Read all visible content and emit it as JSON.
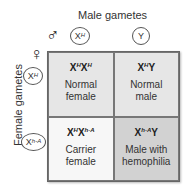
{
  "header": {
    "male_label": "Male gametes",
    "male_symbol": "♂",
    "female_symbol": "♀"
  },
  "side": {
    "female_label": "Female gametes"
  },
  "male_gametes": [
    {
      "base": "X",
      "sup": "H"
    },
    {
      "base": "Y",
      "sup": ""
    }
  ],
  "female_gametes": [
    {
      "base": "X",
      "sup": "H"
    },
    {
      "base": "X",
      "sup": "h-A"
    }
  ],
  "cells": [
    {
      "geno1": "X",
      "sup1": "H",
      "geno2": "X",
      "sup2": "H",
      "pheno1": "Normal",
      "pheno2": "female",
      "color": "#e6e6e6"
    },
    {
      "geno1": "X",
      "sup1": "H",
      "geno2": "Y",
      "sup2": "",
      "pheno1": "Normal",
      "pheno2": "male",
      "color": "#e6e6e6"
    },
    {
      "geno1": "X",
      "sup1": "H",
      "geno2": "X",
      "sup2": "h-A",
      "pheno1": "Carrier",
      "pheno2": "female",
      "color": "#f7f7f7"
    },
    {
      "geno1": "X",
      "sup1": "h-A",
      "geno2": "Y",
      "sup2": "",
      "pheno1": "Male with",
      "pheno2": "hemophilia",
      "color": "#d2d2d2"
    }
  ]
}
